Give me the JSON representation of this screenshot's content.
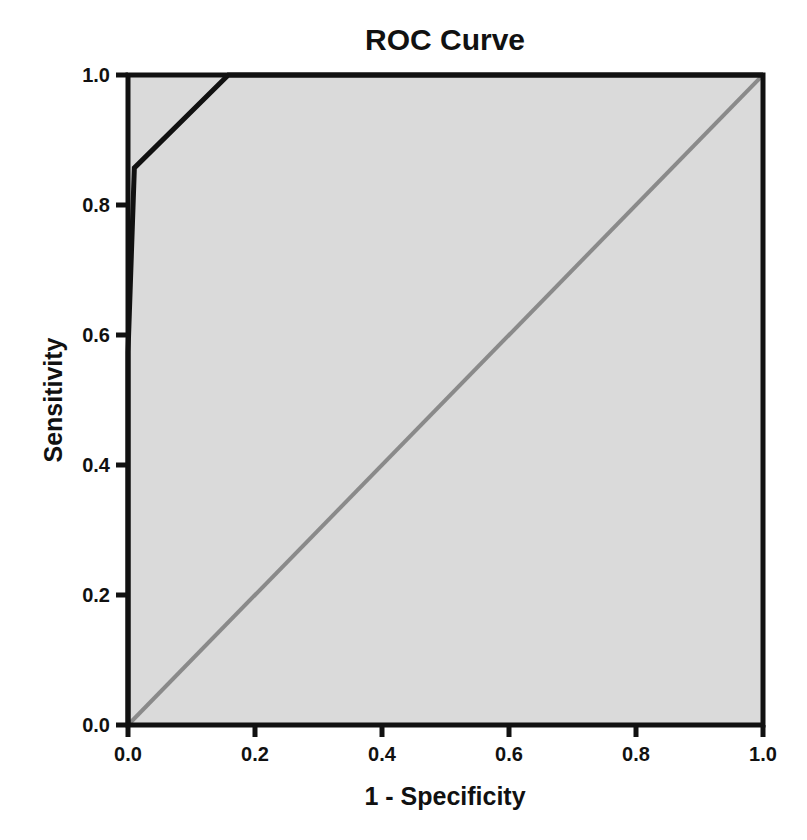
{
  "chart_data": {
    "type": "line",
    "title": "ROC Curve",
    "xlabel": "1 - Specificity",
    "ylabel": "Sensitivity",
    "xlim": [
      0.0,
      1.0
    ],
    "ylim": [
      0.0,
      1.0
    ],
    "xticks": [
      "0.0",
      "0.2",
      "0.4",
      "0.6",
      "0.8",
      "1.0"
    ],
    "yticks": [
      "0.0",
      "0.2",
      "0.4",
      "0.6",
      "0.8",
      "1.0"
    ],
    "grid": false,
    "legend": null,
    "series": [
      {
        "name": "ROC curve",
        "color": "#111111",
        "x": [
          0.0,
          0.0,
          0.01,
          0.158,
          1.0
        ],
        "y": [
          0.0,
          0.574,
          0.857,
          1.0,
          1.0
        ]
      },
      {
        "name": "Reference line",
        "color": "#8a8a8a",
        "x": [
          0.0,
          1.0
        ],
        "y": [
          0.0,
          1.0
        ]
      }
    ],
    "plot_background": "#dadada"
  }
}
